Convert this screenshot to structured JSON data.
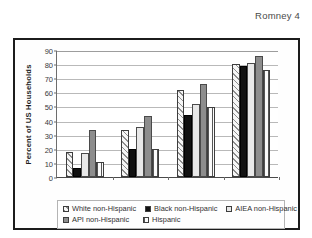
{
  "page": {
    "header_label": "Romney 4"
  },
  "chart_data": {
    "type": "bar",
    "title": "",
    "subtitle": "",
    "xlabel": "",
    "ylabel": "Percent of US Households",
    "ylim": [
      0,
      90
    ],
    "ytick_step": 10,
    "yticks": [
      0,
      10,
      20,
      30,
      40,
      50,
      60,
      70,
      80,
      90
    ],
    "ytick_labels": [
      "0",
      "10",
      "20",
      "30",
      "40",
      "50",
      "60",
      "70",
      "80",
      "90"
    ],
    "grid": true,
    "grid_axis": "y",
    "legend_position": "bottom",
    "categories": [
      "Under $15,000",
      "15,000–34,999",
      "35,000–74,999",
      "75,000+"
    ],
    "series": [
      {
        "name": "White non-Hispanic",
        "pattern": "diagonal-hatch",
        "color": "#f6f6f6",
        "values": [
          18,
          33,
          61.5,
          80
        ]
      },
      {
        "name": "Black non-Hispanic",
        "pattern": "solid",
        "color": "#111111",
        "values": [
          6.5,
          20,
          44,
          78.5
        ]
      },
      {
        "name": "AIEA non-Hispanic",
        "pattern": "solid-light",
        "color": "#e8e8e8",
        "values": [
          17,
          35.5,
          52,
          80.5
        ]
      },
      {
        "name": "API non-Hispanic",
        "pattern": "solid-gray",
        "color": "#8d8d8d",
        "values": [
          33,
          43,
          66,
          85.5
        ]
      },
      {
        "name": "Hispanic",
        "pattern": "vertical-stripes",
        "color": "#fbfbfb",
        "values": [
          10.5,
          20,
          49.5,
          76
        ]
      }
    ]
  },
  "legend": {
    "entries": [
      {
        "label": "White non-Hispanic"
      },
      {
        "label": "Black non-Hispanic"
      },
      {
        "label": "AIEA non-Hispanic"
      },
      {
        "label": "API non-Hispanic"
      },
      {
        "label": "Hispanic"
      }
    ]
  }
}
